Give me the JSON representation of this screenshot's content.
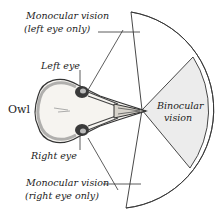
{
  "diagram": {
    "labels": {
      "owl": "Owl",
      "left_eye": "Left eye",
      "right_eye": "Right eye",
      "mono_left_line1": "Monocular vision",
      "mono_left_line2": "(left eye only)",
      "mono_right_line1": "Monocular vision",
      "mono_right_line2": "(right eye only)",
      "binocular_line1": "Binocular",
      "binocular_line2": "vision"
    },
    "colors": {
      "binocular_fill": "#ececec",
      "line": "#333333",
      "background": "#ffffff"
    }
  }
}
